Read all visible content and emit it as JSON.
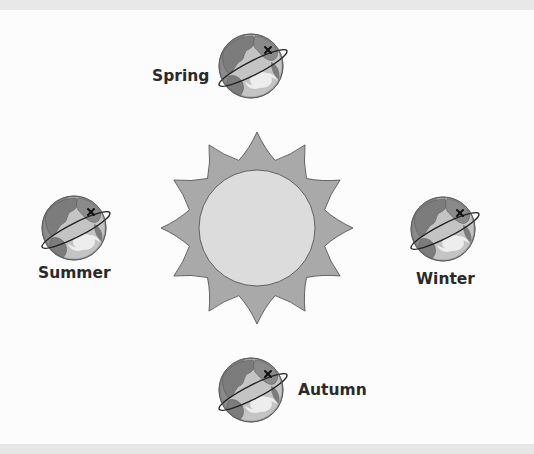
{
  "diagram": {
    "colors": {
      "background": "#fcfcfc",
      "sun_rays": "#a9a9a9",
      "sun_core": "#dcdcdc",
      "outline": "#555555",
      "globe_ocean": "#c4c4c4",
      "globe_land": "#7c7c7c",
      "globe_shadow": "#6a6a6a",
      "band": "#e8e8e8"
    },
    "sun": {
      "cx": 257,
      "cy": 228,
      "inner_r": 58,
      "outer_r": 96,
      "spikes": 12
    },
    "seasons": [
      {
        "id": "spring",
        "label": "Spring",
        "globe": {
          "cx": 251,
          "cy": 66
        },
        "label_pos": {
          "left": 152,
          "top": 69
        }
      },
      {
        "id": "summer",
        "label": "Summer",
        "globe": {
          "cx": 74,
          "cy": 228
        },
        "label_pos": {
          "left": 38,
          "top": 266
        }
      },
      {
        "id": "winter",
        "label": "Winter",
        "globe": {
          "cx": 443,
          "cy": 229
        },
        "label_pos": {
          "left": 416,
          "top": 272
        }
      },
      {
        "id": "autumn",
        "label": "Autumn",
        "globe": {
          "cx": 251,
          "cy": 390
        },
        "label_pos": {
          "left": 298,
          "top": 383
        }
      }
    ]
  }
}
